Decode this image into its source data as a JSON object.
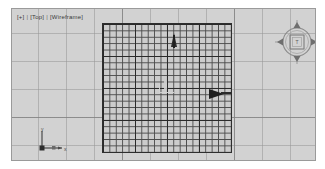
{
  "app": {
    "title": "3D Viewport",
    "type": "orthographic-viewport"
  },
  "viewport": {
    "label": {
      "plus": "[+]",
      "view": "[Top]",
      "shading": "[Wireframe]",
      "separator": "|"
    },
    "background_color": "#d2d2d2",
    "border_color": "#9a9a9a",
    "grid": {
      "background_spacing_px": 28,
      "background_major_spacing_px": 112,
      "home_grid_color": "#4a4a4a",
      "home_grid_cells": 20,
      "home_grid_cell_px": 6.4,
      "home_grid_major_every": 5,
      "home_grid_border_color": "#2e2e2e"
    }
  },
  "objects": [
    {
      "name": "cone-object",
      "shape": "cone",
      "color": "#2b2b2b",
      "position": {
        "x": 159,
        "y": 24
      }
    },
    {
      "name": "wedge-object",
      "shape": "wedge-arrow",
      "color": "#1f1f1f",
      "position": {
        "x": 197,
        "y": 80
      }
    },
    {
      "name": "pivot-marker",
      "shape": "corner-gizmo",
      "color": "#d2d2d2",
      "position": {
        "x": 147,
        "y": 75
      }
    }
  ],
  "axis_tripod": {
    "x_label": "x",
    "y_label": "y",
    "color": "#4a4a4a"
  },
  "viewcube": {
    "face_label": "T",
    "ring_color": "#8a8a8a",
    "cube_color": "#9c9c9c",
    "arrows": [
      "up",
      "down",
      "left",
      "right"
    ]
  }
}
